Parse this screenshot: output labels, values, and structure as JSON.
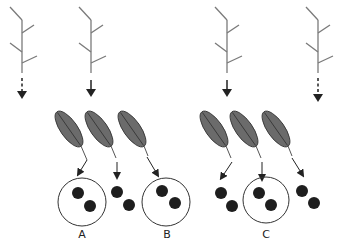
{
  "diagram": {
    "colors": {
      "stem": "#7a7a7a",
      "arrow": "#222222",
      "seed_fill": "#6b6b6b",
      "seed_stroke": "#3a3a3a",
      "dot": "#1e1e1e",
      "circle": "#333333"
    },
    "plants": [
      {
        "id": "plant-1",
        "stem_x": 22,
        "arrow": "dashed"
      },
      {
        "id": "plant-2",
        "stem_x": 91,
        "arrow": "solid"
      },
      {
        "id": "plant-3",
        "stem_x": 227,
        "arrow": "solid"
      },
      {
        "id": "plant-4",
        "stem_x": 318,
        "arrow": "dashed"
      }
    ],
    "seed_groups": [
      {
        "id": "group-left",
        "seeds": 3
      },
      {
        "id": "group-right",
        "seeds": 3
      }
    ],
    "labels": [
      {
        "id": "A",
        "text": "A"
      },
      {
        "id": "B",
        "text": "B"
      },
      {
        "id": "C",
        "text": "C"
      }
    ]
  }
}
